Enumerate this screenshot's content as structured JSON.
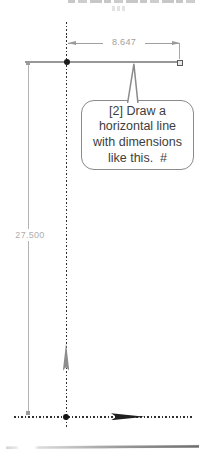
{
  "sketch": {
    "colors": {
      "centerline": "#2f2f2f",
      "sketch_line": "#989898",
      "dimension": "#a0a0a0",
      "origin_dot": "#141414",
      "endpoint_fill": "#e9e9e9",
      "endpoint_border": "#5a5a5a",
      "up_arrow": "#8d8d8d",
      "right_arrow": "#1f1f1f"
    },
    "dimensions": {
      "horizontal_value": "8.647",
      "vertical_value": "27.500"
    }
  },
  "callout": {
    "border_color": "#8a8a8a",
    "text_color": "#3d3d3d",
    "lines": [
      "[2] Draw a",
      "horizontal line",
      "with dimensions",
      "like this.  #"
    ]
  }
}
